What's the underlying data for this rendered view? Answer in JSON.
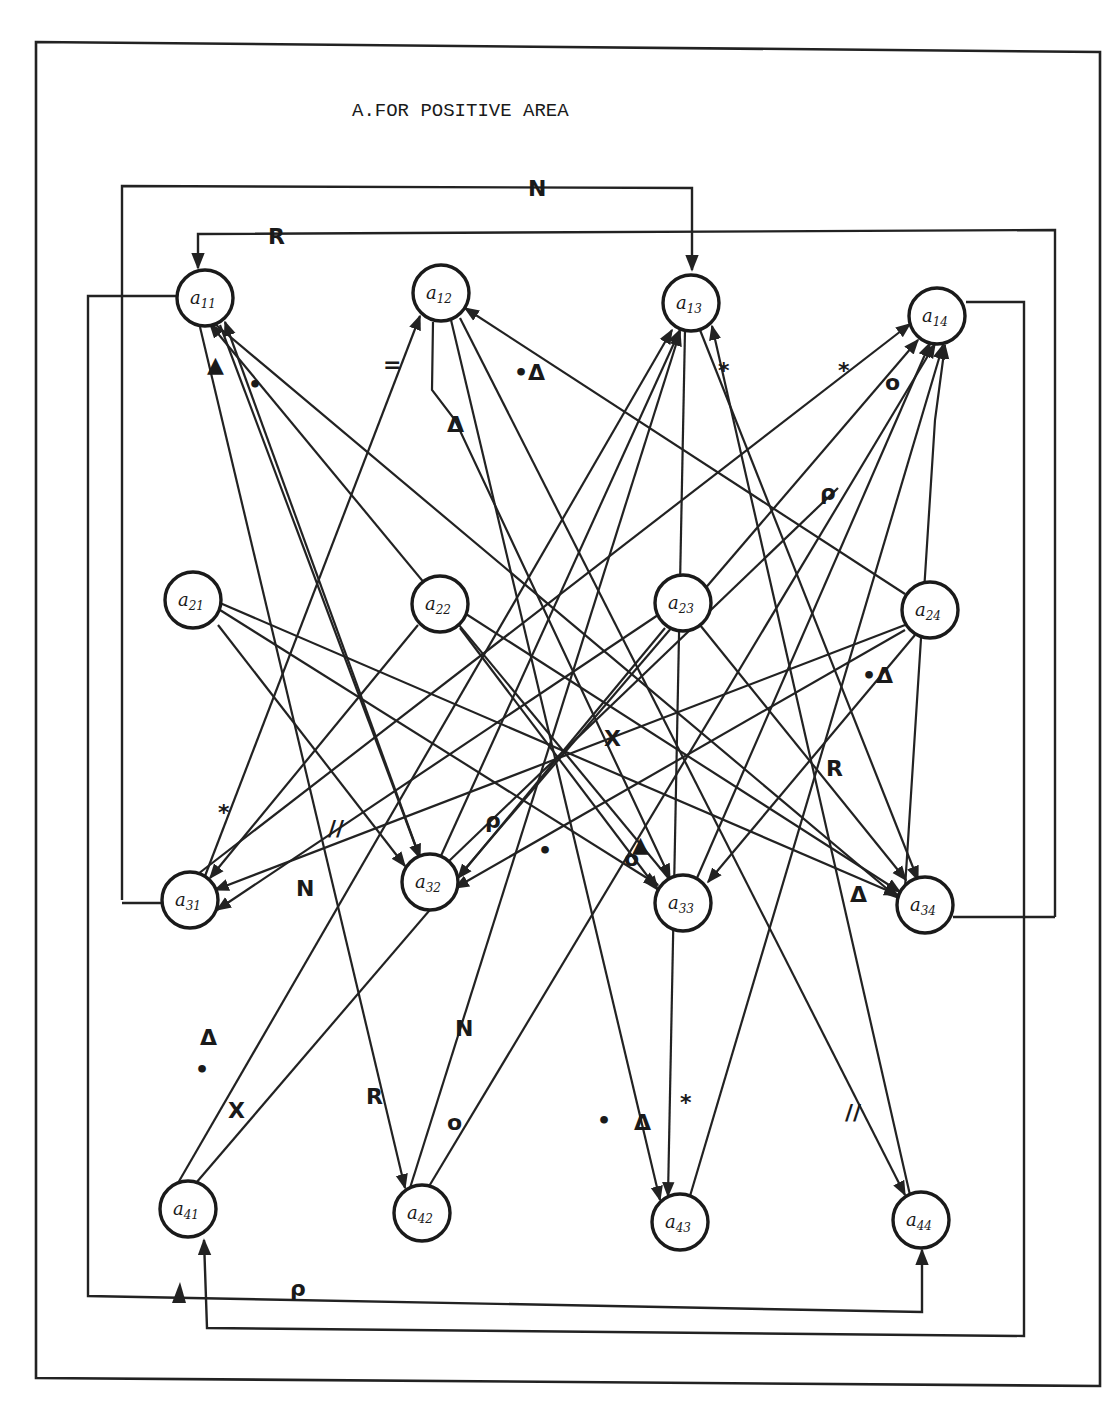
{
  "title": "A.FOR POSITIVE AREA",
  "colors": {
    "ink": "#222222",
    "paper": "#ffffff"
  },
  "nodes": [
    {
      "id": "a11",
      "base": "a",
      "sub": "11",
      "x": 205,
      "y": 298
    },
    {
      "id": "a12",
      "base": "a",
      "sub": "12",
      "x": 441,
      "y": 293
    },
    {
      "id": "a13",
      "base": "a",
      "sub": "13",
      "x": 691,
      "y": 303
    },
    {
      "id": "a14",
      "base": "a",
      "sub": "14",
      "x": 937,
      "y": 316
    },
    {
      "id": "a21",
      "base": "a",
      "sub": "21",
      "x": 193,
      "y": 600
    },
    {
      "id": "a22",
      "base": "a",
      "sub": "22",
      "x": 440,
      "y": 604
    },
    {
      "id": "a23",
      "base": "a",
      "sub": "23",
      "x": 683,
      "y": 603
    },
    {
      "id": "a24",
      "base": "a",
      "sub": "24",
      "x": 930,
      "y": 610
    },
    {
      "id": "a31",
      "base": "a",
      "sub": "31",
      "x": 190,
      "y": 900
    },
    {
      "id": "a32",
      "base": "a",
      "sub": "32",
      "x": 430,
      "y": 882
    },
    {
      "id": "a33",
      "base": "a",
      "sub": "33",
      "x": 683,
      "y": 903
    },
    {
      "id": "a34",
      "base": "a",
      "sub": "34",
      "x": 925,
      "y": 905
    },
    {
      "id": "a41",
      "base": "a",
      "sub": "41",
      "x": 188,
      "y": 1209
    },
    {
      "id": "a42",
      "base": "a",
      "sub": "42",
      "x": 422,
      "y": 1213
    },
    {
      "id": "a43",
      "base": "a",
      "sub": "43",
      "x": 680,
      "y": 1222
    },
    {
      "id": "a44",
      "base": "a",
      "sub": "44",
      "x": 921,
      "y": 1220
    }
  ],
  "edges": [
    {
      "from": "a21",
      "to": "a32"
    },
    {
      "from": "a21",
      "to": "a33"
    },
    {
      "from": "a21",
      "to": "a34"
    },
    {
      "from": "a22",
      "to": "a33",
      "label": "•"
    },
    {
      "from": "a22",
      "to": "a34"
    },
    {
      "from": "a22",
      "to": "a31",
      "label": "*"
    },
    {
      "from": "a23",
      "to": "a31",
      "label": "N"
    },
    {
      "from": "a23",
      "to": "a32",
      "label": "ρ"
    },
    {
      "from": "a23",
      "to": "a34",
      "label": "R"
    },
    {
      "from": "a24",
      "to": "a31",
      "label": "//"
    },
    {
      "from": "a24",
      "to": "a32"
    },
    {
      "from": "a24",
      "to": "a33",
      "label": "•Δ"
    },
    {
      "from": "a24",
      "to": "a12",
      "label": "•Δ"
    },
    {
      "from": "a11",
      "to": "a34",
      "label": "X"
    },
    {
      "from": "a11",
      "to": "a32"
    },
    {
      "from": "a11",
      "to": "a42",
      "label": "R"
    },
    {
      "from": "a12",
      "to": "a33",
      "label": "▲"
    },
    {
      "from": "a12",
      "to": "a43",
      "label": "•"
    },
    {
      "from": "a12",
      "to": "a44",
      "label": "//"
    },
    {
      "from": "a13",
      "to": "a43",
      "label": "Δ"
    },
    {
      "from": "a13",
      "to": "a34"
    },
    {
      "from": "a31",
      "to": "a12",
      "label": "="
    },
    {
      "from": "a32",
      "to": "a13"
    },
    {
      "from": "a32",
      "to": "a11",
      "label": "•"
    },
    {
      "from": "a33",
      "to": "a11",
      "label": "▲"
    },
    {
      "from": "a33",
      "to": "a14",
      "label": "o"
    },
    {
      "from": "a44",
      "to": "a13",
      "label": "*"
    },
    {
      "from": "a31",
      "to": "a14",
      "label": "*"
    },
    {
      "from": "a41",
      "to": "a13",
      "label": "Δ•"
    },
    {
      "from": "a41",
      "to": "a14",
      "label": "X"
    },
    {
      "from": "a42",
      "to": "a13",
      "label": "N"
    },
    {
      "from": "a42",
      "to": "a14",
      "label": "o"
    },
    {
      "from": "a43",
      "to": "a14",
      "label": "*"
    },
    {
      "from": "a32",
      "to": "a14",
      "label": "ρ"
    },
    {
      "from": "a34",
      "to": "a14",
      "label": "Δ"
    }
  ],
  "routed_labels": {
    "top_N": "N",
    "top_R": "R",
    "bottom_rho": "ρ",
    "a33_o": "o",
    "a34_delta": "Δ",
    "a12_delta": "Δ",
    "a13_star": "*"
  }
}
